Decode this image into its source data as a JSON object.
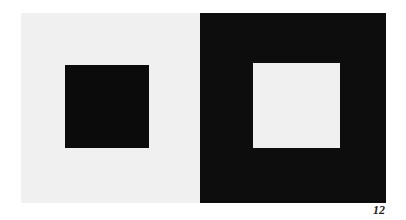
{
  "figure": {
    "plate_number": "12",
    "colors": {
      "left_background": "#f0f0f0",
      "left_square": "#0b0b0b",
      "right_background": "#0d0d0d",
      "right_square": "#f0f0f0"
    }
  }
}
